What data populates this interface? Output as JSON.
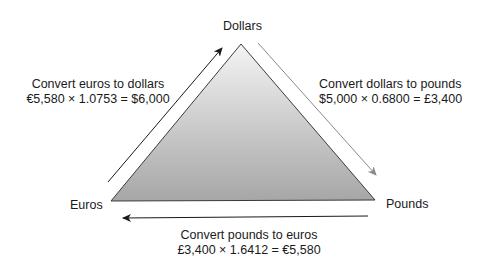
{
  "nodes": {
    "top": "Dollars",
    "left": "Euros",
    "right": "Pounds"
  },
  "edges": {
    "euros_to_dollars": {
      "title": "Convert euros to dollars",
      "formula": "€5,580 × 1.0753 = $6,000"
    },
    "dollars_to_pounds": {
      "title": "Convert dollars to pounds",
      "formula": "$5,000 × 0.6800 = £3,400"
    },
    "pounds_to_euros": {
      "title": "Convert pounds to euros",
      "formula": "£3,400 × 1.6412 = €5,580"
    }
  },
  "colors": {
    "triangle_top": "#f2f2f2",
    "triangle_bottom": "#a8a8a8",
    "arrow_dark": "#1a1a1a",
    "arrow_gray": "#8a8a8a"
  }
}
